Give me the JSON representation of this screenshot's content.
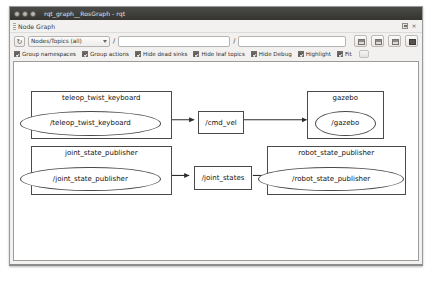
{
  "window": {
    "title": "rqt_graph__RosGraph - rqt",
    "controls": [
      "close",
      "minimize",
      "maximize"
    ]
  },
  "dock": {
    "title": "Node Graph",
    "float_label": "float",
    "close_label": "×"
  },
  "toolbar": {
    "refresh_label": "↻",
    "filter_mode": "Nodes/Topics (all)",
    "filter_mode_options": [
      "Nodes only",
      "Nodes/Topics (active)",
      "Nodes/Topics (all)"
    ],
    "slash_prefix_1": "/",
    "topic_filter_value": "",
    "topic_filter_placeholder": "",
    "slash_prefix_2": "/",
    "node_filter_value": "",
    "node_filter_placeholder": "",
    "buttons": [
      {
        "name": "save-dot-button",
        "label": ""
      },
      {
        "name": "load-dot-button",
        "label": ""
      },
      {
        "name": "save-image-button",
        "label": ""
      },
      {
        "name": "fit-in-view-button",
        "label": ""
      }
    ]
  },
  "options": {
    "checkboxes": [
      {
        "label": "Group namespaces",
        "checked": true
      },
      {
        "label": "Group actions",
        "checked": true
      },
      {
        "label": "Hide dead sinks",
        "checked": true
      },
      {
        "label": "Hide leaf topics",
        "checked": true
      },
      {
        "label": "Hide Debug",
        "checked": true
      },
      {
        "label": "Highlight",
        "checked": true
      },
      {
        "label": "Fit",
        "checked": true
      }
    ],
    "more_button_label": ""
  },
  "graph": {
    "clusters": [
      {
        "id": "cluster-teleop",
        "label": "teleop_twist_keyboard",
        "node": "/teleop_twist_keyboard"
      },
      {
        "id": "cluster-gazebo",
        "label": "gazebo",
        "node": "/gazebo"
      },
      {
        "id": "cluster-jsp",
        "label": "joint_state_publisher",
        "node": "/joint_state_publisher"
      },
      {
        "id": "cluster-rsp",
        "label": "robot_state_publisher",
        "node": "/robot_state_publisher"
      }
    ],
    "topics": [
      {
        "id": "topic-cmd-vel",
        "label": "/cmd_vel"
      },
      {
        "id": "topic-joint-states",
        "label": "/joint_states"
      }
    ],
    "edges": [
      {
        "from": "/teleop_twist_keyboard",
        "to": "/cmd_vel"
      },
      {
        "from": "/cmd_vel",
        "to": "/gazebo"
      },
      {
        "from": "/joint_state_publisher",
        "to": "/joint_states"
      },
      {
        "from": "/joint_states",
        "to": "/robot_state_publisher"
      }
    ]
  }
}
